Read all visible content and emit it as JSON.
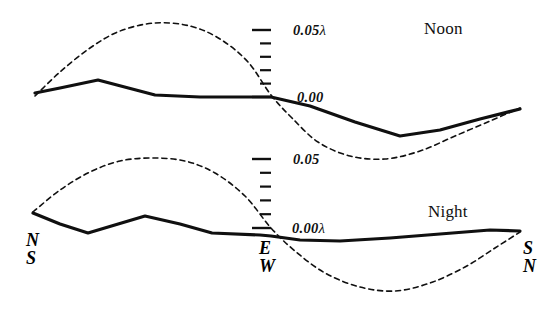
{
  "figure": {
    "background_color": "#ffffff",
    "ink_color": "#101010",
    "width": 553,
    "height": 310
  },
  "panels": [
    {
      "id": "noon",
      "title": "Noon",
      "title_pos": {
        "x": 424,
        "y": 20
      },
      "scale": {
        "top_label": "0.05",
        "top_lambda": "λ",
        "bottom_label": "0.00",
        "bottom_lambda": "",
        "axis_x": 271,
        "top_y": 30,
        "bottom_y": 97,
        "tick_count": 6,
        "long_tick_len": 19,
        "short_tick_len": 11,
        "top_label_pos": {
          "x": 293,
          "y": 22
        },
        "bottom_label_pos": {
          "x": 297,
          "y": 89
        }
      }
    },
    {
      "id": "night",
      "title": "Night",
      "title_pos": {
        "x": 428,
        "y": 203
      },
      "scale": {
        "top_label": "0.05",
        "top_lambda": "",
        "bottom_label": "0.00",
        "bottom_lambda": "λ",
        "axis_x": 271,
        "top_y": 159,
        "bottom_y": 228,
        "tick_count": 6,
        "long_tick_len": 19,
        "short_tick_len": 11,
        "top_label_pos": {
          "x": 293,
          "y": 151
        },
        "bottom_label_pos": {
          "x": 292,
          "y": 220
        }
      }
    }
  ],
  "axis_labels": [
    {
      "id": "left",
      "top": "N",
      "bottom": "S",
      "x": 26,
      "y": 232
    },
    {
      "id": "center",
      "top": "E",
      "bottom": "W",
      "x": 259,
      "y": 240
    },
    {
      "id": "right",
      "top": "S",
      "bottom": "N",
      "x": 523,
      "y": 240
    }
  ],
  "chart_data": {
    "type": "line",
    "xlabel": "",
    "ylabel": "Amplitude (λ)",
    "grid": false,
    "legend": "none",
    "xlim": [
      0,
      553
    ],
    "x_tick_labels": [
      "N / S",
      "E / W",
      "S / N"
    ],
    "series": [
      {
        "name": "noon-observed",
        "panel": "noon",
        "style": "solid",
        "stroke_width": 3.2,
        "points": [
          [
            35,
            93
          ],
          [
            60,
            88
          ],
          [
            98,
            80
          ],
          [
            155,
            95
          ],
          [
            200,
            97
          ],
          [
            260,
            97
          ],
          [
            271,
            97
          ],
          [
            310,
            106
          ],
          [
            355,
            122
          ],
          [
            400,
            136
          ],
          [
            440,
            130
          ],
          [
            480,
            119
          ],
          [
            520,
            109
          ]
        ]
      },
      {
        "name": "noon-theoretical",
        "panel": "noon",
        "style": "dashed",
        "stroke_width": 1.6,
        "dash": "5,4",
        "points": [
          [
            35,
            96
          ],
          [
            60,
            72
          ],
          [
            90,
            48
          ],
          [
            120,
            31
          ],
          [
            155,
            23
          ],
          [
            190,
            26
          ],
          [
            220,
            39
          ],
          [
            248,
            62
          ],
          [
            271,
            95
          ],
          [
            292,
            118
          ],
          [
            318,
            142
          ],
          [
            350,
            156
          ],
          [
            385,
            159
          ],
          [
            420,
            151
          ],
          [
            455,
            136
          ],
          [
            490,
            121
          ],
          [
            520,
            108
          ]
        ]
      },
      {
        "name": "night-observed",
        "panel": "night",
        "style": "solid",
        "stroke_width": 3.2,
        "points": [
          [
            33,
            213
          ],
          [
            60,
            224
          ],
          [
            88,
            233
          ],
          [
            145,
            216
          ],
          [
            180,
            224
          ],
          [
            212,
            233
          ],
          [
            260,
            235
          ],
          [
            271,
            236
          ],
          [
            300,
            240
          ],
          [
            340,
            241
          ],
          [
            390,
            238
          ],
          [
            440,
            234
          ],
          [
            490,
            230
          ],
          [
            520,
            231
          ]
        ]
      },
      {
        "name": "night-theoretical",
        "panel": "night",
        "style": "dashed",
        "stroke_width": 1.6,
        "dash": "5,4",
        "points": [
          [
            33,
            212
          ],
          [
            60,
            190
          ],
          [
            90,
            172
          ],
          [
            120,
            161
          ],
          [
            152,
            158
          ],
          [
            185,
            161
          ],
          [
            215,
            173
          ],
          [
            245,
            196
          ],
          [
            271,
            228
          ],
          [
            295,
            251
          ],
          [
            325,
            273
          ],
          [
            360,
            287
          ],
          [
            395,
            291
          ],
          [
            430,
            283
          ],
          [
            465,
            267
          ],
          [
            495,
            248
          ],
          [
            520,
            232
          ]
        ]
      }
    ]
  }
}
